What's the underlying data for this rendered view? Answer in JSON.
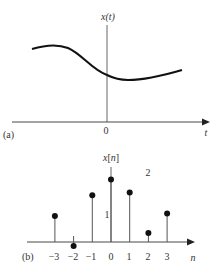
{
  "panel_a": {
    "label": "(a)",
    "y_axis_label": "x(t)",
    "x_axis_label": "t",
    "origin_label": "0",
    "description": "continuous-time signal x(t)"
  },
  "panel_b": {
    "label": "(b)",
    "y_axis_label": "x[n]",
    "x_axis_label": "n",
    "tick_labels": [
      "−3",
      "−2",
      "−1",
      "0",
      "1",
      "2",
      "3"
    ],
    "level_labels": [
      "1",
      "2"
    ],
    "samples": [
      {
        "n": -3,
        "value": 1.0
      },
      {
        "n": -2,
        "value": -0.15
      },
      {
        "n": -1,
        "value": 1.8
      },
      {
        "n": 0,
        "value": 2.4
      },
      {
        "n": 1,
        "value": 1.9
      },
      {
        "n": 2,
        "value": 0.35
      },
      {
        "n": 3,
        "value": 1.1
      }
    ]
  },
  "colors": {
    "curve": "#111111",
    "axis": "#333333",
    "stem": "#555555",
    "dot": "#111111"
  }
}
